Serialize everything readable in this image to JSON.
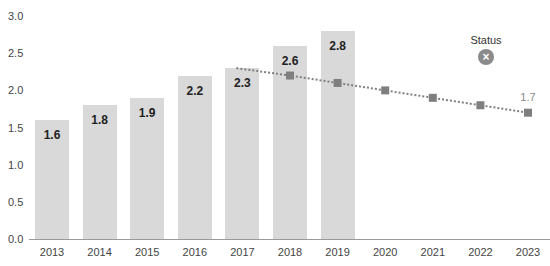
{
  "chart_data": {
    "type": "bar",
    "title": "",
    "xlabel": "",
    "ylabel": "",
    "ylim": [
      0,
      3.0
    ],
    "yticks": [
      "0.0",
      "0.5",
      "1.0",
      "1.5",
      "2.0",
      "2.5",
      "3.0"
    ],
    "categories": [
      "2013",
      "2014",
      "2015",
      "2016",
      "2017",
      "2018",
      "2019",
      "2020",
      "2021",
      "2022",
      "2023"
    ],
    "series": [
      {
        "name": "Actual",
        "type": "bar",
        "color": "#d9d9d9",
        "values": [
          1.6,
          1.8,
          1.9,
          2.2,
          2.3,
          2.6,
          2.8,
          null,
          null,
          null,
          null
        ],
        "labels": [
          "1.6",
          "1.8",
          "1.9",
          "2.2",
          "2.3",
          "2.6",
          "2.8"
        ]
      },
      {
        "name": "Projection",
        "type": "line",
        "style": "dotted",
        "marker": "square",
        "color": "#7f7f7f",
        "values": [
          null,
          null,
          null,
          null,
          2.3,
          2.2,
          2.1,
          2.0,
          1.9,
          1.8,
          1.7
        ],
        "end_label": "1.7"
      }
    ],
    "annotations": [
      {
        "text": "Status",
        "icon": "x-circle-icon",
        "position": "upper-right"
      }
    ],
    "grid": false,
    "legend": null
  },
  "status": {
    "label": "Status",
    "icon": "×"
  }
}
